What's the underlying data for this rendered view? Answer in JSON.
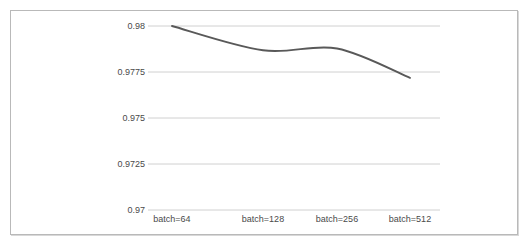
{
  "chart_data": {
    "type": "line",
    "title": "",
    "xlabel": "",
    "ylabel": "",
    "categories": [
      "batch=64",
      "batch=128",
      "batch=256",
      "batch=512"
    ],
    "values": [
      0.98,
      0.97868,
      0.97878,
      0.97718
    ],
    "series": [
      {
        "name": "accuracy",
        "values": [
          0.98,
          0.97868,
          0.97878,
          0.97718
        ]
      }
    ],
    "ylim": [
      0.97,
      0.98
    ],
    "ytick_labels": [
      "0.97",
      "0.9725",
      "0.975",
      "0.9775",
      "0.98"
    ],
    "ytick_values": [
      0.97,
      0.9725,
      0.975,
      0.9775,
      0.98
    ],
    "grid": true,
    "legend": false,
    "legend_position": "none",
    "line_color": "#595959",
    "grid_color": "#d0d0d0",
    "border_color": "#b9b9b9",
    "background_color": "#ffffff"
  }
}
